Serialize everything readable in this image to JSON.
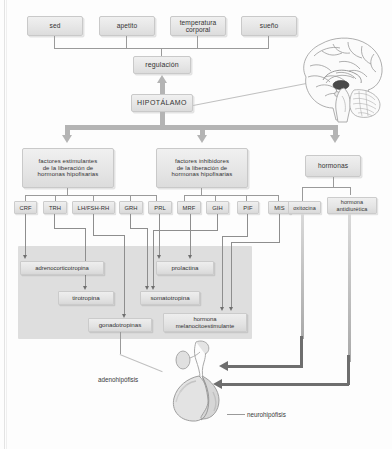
{
  "figure": {
    "top_factors": [
      {
        "label": "sed"
      },
      {
        "label": "apetito"
      },
      {
        "label": "temperatura\ncorporal"
      },
      {
        "label": "sueño"
      }
    ],
    "regulation_box": "regulación",
    "hypothalamus_box": "HIPOTÁLAMO",
    "branch_boxes": [
      {
        "label": "factores estimulantes\nde la liberación de\nhormonas hipofisarias"
      },
      {
        "label": "factores inhibidores\nde la liberación de\nhormonas hipofisarias"
      },
      {
        "label": "hormonas"
      }
    ],
    "releasing_factors": [
      {
        "label": "CRF"
      },
      {
        "label": "TRH"
      },
      {
        "label": "LH/FSH-RH"
      },
      {
        "label": "GRH"
      },
      {
        "label": "PRL"
      },
      {
        "label": "MRF"
      },
      {
        "label": "GIH"
      },
      {
        "label": "PIF"
      },
      {
        "label": "MIS"
      }
    ],
    "posterior_hormones": [
      {
        "label": "oxitocina"
      },
      {
        "label": "hormona\nantidiurética"
      }
    ],
    "anterior_hormones": [
      {
        "label": "adrenocorticotropina"
      },
      {
        "label": "tirotropina"
      },
      {
        "label": "gonadotropinas"
      },
      {
        "label": "somatotropina"
      },
      {
        "label": "prolactina"
      },
      {
        "label": "hormona\nmelanocitoestimulante"
      }
    ],
    "gland_labels": [
      {
        "label": "adenohipófisis"
      },
      {
        "label": "neurohipófisis"
      }
    ],
    "illustrations": [
      {
        "name": "brain-sagittal-illustration"
      },
      {
        "name": "pituitary-gland-illustration"
      }
    ],
    "colors": {
      "box_fill": "#e6e6e6",
      "box_border": "#c9c9c9",
      "plate_fill": "#dcdcdc",
      "band_arrow": "#b4b4b4",
      "dark_arrow": "#6e6e6e",
      "line": "#9a9a9a",
      "text": "#333333",
      "page_background": "#fdfdfd"
    }
  }
}
